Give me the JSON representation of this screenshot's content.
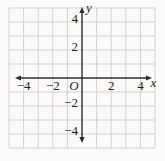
{
  "chart_data": {
    "type": "scatter",
    "title": "",
    "xlabel": "x",
    "ylabel": "y",
    "origin_label": "O",
    "xlim": [
      -5,
      5
    ],
    "ylim": [
      -5,
      5
    ],
    "x_tick_values": [
      -4,
      -2,
      2,
      4
    ],
    "x_tick_labels": [
      "−4",
      "−2",
      "2",
      "4"
    ],
    "y_tick_values": [
      4,
      2,
      -2,
      -4
    ],
    "y_tick_labels": [
      "4",
      "2",
      "−2",
      "−4"
    ],
    "grid": true,
    "legend": false,
    "series": [],
    "colors": {
      "grid": "#d2d2d2",
      "axis": "#2d2d2d",
      "text": "#1f1f1f",
      "background": "#fbfaf8"
    }
  }
}
